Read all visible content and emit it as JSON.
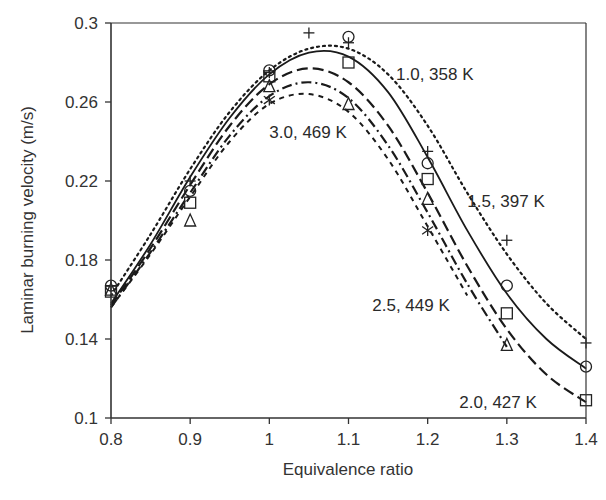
{
  "chart_data": {
    "type": "line",
    "title": "",
    "xlabel": "Equivalence ratio",
    "ylabel": "Laminar burning velocity (m/s)",
    "xlim": [
      0.8,
      1.4
    ],
    "ylim": [
      0.1,
      0.3
    ],
    "x_ticks": [
      "0.8",
      "0.9",
      "1",
      "1.1",
      "1.2",
      "1.3",
      "1.4"
    ],
    "y_ticks": [
      "0.1",
      "0.14",
      "0.18",
      "0.22",
      "0.26",
      "0.3"
    ],
    "grid": false,
    "legend": "none (inline annotations)",
    "x": [
      0.8,
      0.9,
      1.0,
      1.1,
      1.2,
      1.3,
      1.4
    ],
    "series": [
      {
        "name": "1.0, 358 K",
        "marker": "circle",
        "line_style": "solid",
        "points": [
          [
            0.8,
            0.167
          ],
          [
            0.9,
            0.215
          ],
          [
            1.0,
            0.276
          ],
          [
            1.1,
            0.293
          ],
          [
            1.2,
            0.229
          ],
          [
            1.3,
            0.167
          ],
          [
            1.4,
            0.126
          ]
        ],
        "curve": [
          [
            0.8,
            0.158
          ],
          [
            0.85,
            0.188
          ],
          [
            0.9,
            0.222
          ],
          [
            0.95,
            0.252
          ],
          [
            1.0,
            0.274
          ],
          [
            1.05,
            0.285
          ],
          [
            1.1,
            0.283
          ],
          [
            1.15,
            0.265
          ],
          [
            1.2,
            0.232
          ],
          [
            1.25,
            0.195
          ],
          [
            1.3,
            0.163
          ],
          [
            1.35,
            0.14
          ],
          [
            1.4,
            0.125
          ]
        ]
      },
      {
        "name": "1.5, 397 K",
        "marker": "plus",
        "line_style": "dotted",
        "points": [
          [
            0.8,
            0.167
          ],
          [
            0.9,
            0.22
          ],
          [
            1.0,
            0.275
          ],
          [
            1.05,
            0.295
          ],
          [
            1.1,
            0.29
          ],
          [
            1.2,
            0.235
          ],
          [
            1.3,
            0.19
          ],
          [
            1.4,
            0.138
          ]
        ],
        "curve": [
          [
            0.8,
            0.162
          ],
          [
            0.85,
            0.193
          ],
          [
            0.9,
            0.226
          ],
          [
            0.95,
            0.255
          ],
          [
            1.0,
            0.276
          ],
          [
            1.05,
            0.287
          ],
          [
            1.1,
            0.287
          ],
          [
            1.15,
            0.274
          ],
          [
            1.2,
            0.248
          ],
          [
            1.25,
            0.214
          ],
          [
            1.3,
            0.183
          ],
          [
            1.35,
            0.158
          ],
          [
            1.4,
            0.14
          ]
        ]
      },
      {
        "name": "2.0, 427 K",
        "marker": "square",
        "line_style": "dashed",
        "points": [
          [
            0.8,
            0.164
          ],
          [
            0.9,
            0.209
          ],
          [
            1.0,
            0.273
          ],
          [
            1.1,
            0.28
          ],
          [
            1.2,
            0.221
          ],
          [
            1.3,
            0.153
          ],
          [
            1.4,
            0.109
          ]
        ],
        "curve": [
          [
            0.8,
            0.157
          ],
          [
            0.85,
            0.186
          ],
          [
            0.9,
            0.218
          ],
          [
            0.95,
            0.248
          ],
          [
            1.0,
            0.269
          ],
          [
            1.05,
            0.277
          ],
          [
            1.1,
            0.27
          ],
          [
            1.15,
            0.248
          ],
          [
            1.2,
            0.214
          ],
          [
            1.25,
            0.177
          ],
          [
            1.3,
            0.145
          ],
          [
            1.35,
            0.122
          ],
          [
            1.4,
            0.108
          ]
        ]
      },
      {
        "name": "2.5, 449 K",
        "marker": "triangle",
        "line_style": "dash-dot",
        "points": [
          [
            0.8,
            0.165
          ],
          [
            0.9,
            0.2
          ],
          [
            1.0,
            0.268
          ],
          [
            1.1,
            0.259
          ],
          [
            1.2,
            0.211
          ],
          [
            1.3,
            0.137
          ]
        ],
        "curve": [
          [
            0.8,
            0.156
          ],
          [
            0.85,
            0.184
          ],
          [
            0.9,
            0.214
          ],
          [
            0.95,
            0.243
          ],
          [
            1.0,
            0.263
          ],
          [
            1.05,
            0.27
          ],
          [
            1.1,
            0.262
          ],
          [
            1.15,
            0.238
          ],
          [
            1.2,
            0.204
          ],
          [
            1.25,
            0.168
          ],
          [
            1.3,
            0.136
          ]
        ]
      },
      {
        "name": "3.0, 469 K",
        "marker": "asterisk",
        "line_style": "short-dashed",
        "points": [
          [
            1.0,
            0.261
          ],
          [
            1.2,
            0.195
          ]
        ],
        "curve": [
          [
            0.8,
            0.156
          ],
          [
            0.85,
            0.183
          ],
          [
            0.9,
            0.212
          ],
          [
            0.95,
            0.24
          ],
          [
            1.0,
            0.259
          ],
          [
            1.05,
            0.264
          ],
          [
            1.1,
            0.255
          ],
          [
            1.15,
            0.231
          ],
          [
            1.2,
            0.197
          ],
          [
            1.25,
            0.162
          ]
        ]
      }
    ],
    "annotations": [
      {
        "text": "1.0, 358 K",
        "x": 1.16,
        "y": 0.271
      },
      {
        "text": "1.5, 397 K",
        "x": 1.25,
        "y": 0.207
      },
      {
        "text": "3.0, 469 K",
        "x": 1.0,
        "y": 0.242
      },
      {
        "text": "2.5, 449 K",
        "x": 1.13,
        "y": 0.154
      },
      {
        "text": "2.0, 427 K",
        "x": 1.24,
        "y": 0.105
      }
    ]
  }
}
